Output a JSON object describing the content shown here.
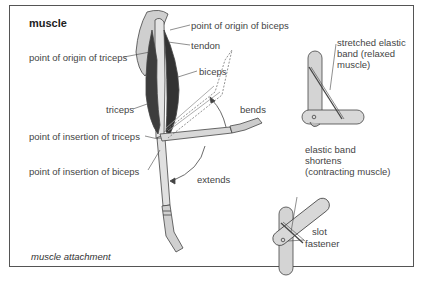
{
  "diagram": {
    "title": "muscle",
    "caption": "muscle attachment",
    "arm_labels": {
      "origin_biceps": "point of origin of biceps",
      "tendon": "tendon",
      "origin_triceps": "point of origin of triceps",
      "biceps": "biceps",
      "triceps": "triceps",
      "bends": "bends",
      "insertion_triceps": "point of insertion of triceps",
      "insertion_biceps": "point of insertion of biceps",
      "extends": "extends"
    },
    "model_relaxed": {
      "label_line1": "stretched elastic",
      "label_line2": "band (relaxed",
      "label_line3": "muscle)"
    },
    "model_contracting": {
      "label_line1": "elastic band",
      "label_line2": "shortens",
      "label_line3": "(contracting muscle)",
      "slot": "slot",
      "fastener": "fastener"
    },
    "colors": {
      "frame": "#555555",
      "muscle": "#3a3a3a",
      "bone": "#d9d9d9",
      "stick": "#d4d4d4",
      "outline": "#444444"
    }
  }
}
